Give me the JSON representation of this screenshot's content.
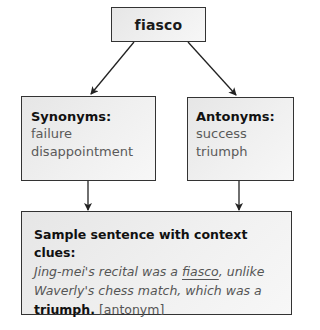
{
  "diagram": {
    "top": {
      "word": "fiasco"
    },
    "synonyms": {
      "heading": "Synonyms:",
      "items": [
        "failure",
        "disappointment"
      ]
    },
    "antonyms": {
      "heading": "Antonyms:",
      "items": [
        "success",
        "triumph"
      ]
    },
    "sample": {
      "heading": "Sample sentence with context clues:",
      "sentence": {
        "part1": "Jing-mei's recital was a ",
        "target": "fiasco",
        "part2": ", unlike",
        "part3": "Waverly's chess match, which was a",
        "clue": "triumph.",
        "tag": " [antonym]"
      }
    },
    "colors": {
      "border": "#333333",
      "box_fill": "#ececec",
      "heading_text": "#111111",
      "body_text": "#555555"
    }
  }
}
